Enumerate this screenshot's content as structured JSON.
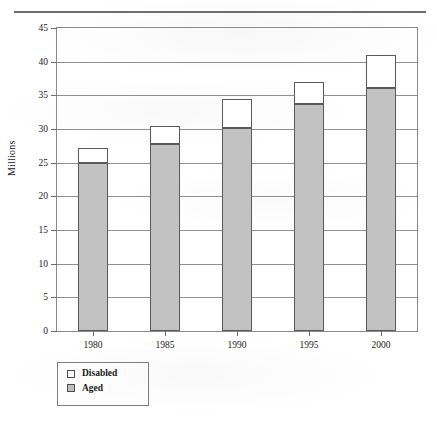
{
  "page": {
    "has_top_rule": true
  },
  "chart_data": {
    "type": "bar",
    "title": "",
    "subtype": "stacked",
    "xlabel": "",
    "ylabel": "Millions",
    "categories": [
      "1980",
      "1985",
      "1990",
      "1995",
      "2000"
    ],
    "ylim": [
      0,
      45
    ],
    "yticks": [
      0,
      5,
      10,
      15,
      20,
      25,
      30,
      35,
      40,
      45
    ],
    "ytick_labels": [
      "0",
      "5",
      "10",
      "15",
      "20",
      "25",
      "30",
      "35",
      "40",
      "45"
    ],
    "grid": true,
    "grid_axis": "y",
    "legend_position": "below-left",
    "series": [
      {
        "name": "Aged",
        "color": "#c2c2c2",
        "values": [
          25.0,
          27.8,
          30.1,
          33.7,
          36.1
        ]
      },
      {
        "name": "Disabled",
        "color": "#ffffff",
        "values": [
          2.2,
          2.7,
          4.3,
          3.3,
          4.9
        ]
      }
    ],
    "totals": [
      27.2,
      30.5,
      34.4,
      37.0,
      41.0
    ],
    "stack_order": [
      "Aged",
      "Disabled"
    ]
  },
  "legend": {
    "entries": [
      {
        "label": "Disabled",
        "swatch": "white-square"
      },
      {
        "label": "Aged",
        "swatch": "gray-square"
      }
    ]
  },
  "colors": {
    "aged_fill": "#c2c2c2",
    "disabled_fill": "#ffffff",
    "bar_stroke": "#5a5a5a",
    "grid": "#8f8f8f",
    "frame": "#8a8a8a",
    "text": "#1a1a1a"
  }
}
